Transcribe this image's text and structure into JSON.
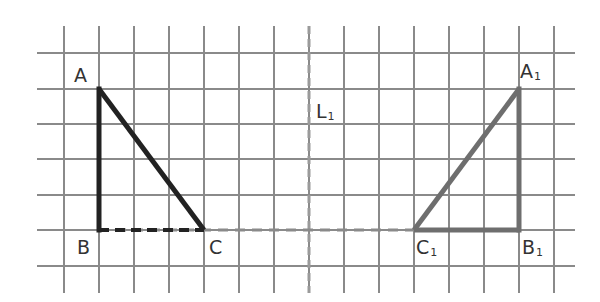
{
  "diagram": {
    "type": "reflection-on-grid",
    "grid": {
      "cell_size": 35.2,
      "x_lines": [
        64,
        99,
        134,
        169,
        204,
        239,
        274,
        309,
        344,
        379,
        414,
        449,
        484,
        519,
        554
      ],
      "y_lines": [
        53,
        89,
        124,
        159,
        195,
        230,
        266
      ],
      "x_extent": [
        37,
        575
      ],
      "y_extent": [
        26,
        293
      ],
      "color": "#8a8a8a"
    },
    "original_triangle": {
      "name": "ABC",
      "color": "#222222",
      "vertices": {
        "A": {
          "label": "A",
          "x": 99,
          "y": 89
        },
        "B": {
          "label": "B",
          "x": 99,
          "y": 230
        },
        "C": {
          "label": "C",
          "x": 204,
          "y": 230
        }
      }
    },
    "image_triangle": {
      "name": "A1B1C1",
      "color": "#6e6e6e",
      "vertices": {
        "A1": {
          "label": "A",
          "sub": "1",
          "x": 519,
          "y": 89
        },
        "B1": {
          "label": "B",
          "sub": "1",
          "x": 519,
          "y": 230
        },
        "C1": {
          "label": "C",
          "sub": "1",
          "x": 414,
          "y": 230
        }
      }
    },
    "mirror_line": {
      "label": "L",
      "sub": "1",
      "x": 309,
      "style": "dashed",
      "color": "#9a9a9a"
    },
    "dashed_baseline": {
      "from_x": 99,
      "to_x": 414,
      "y": 230,
      "color": "#8a8a8a"
    }
  },
  "labels": {
    "A": "A",
    "B": "B",
    "C": "C",
    "A1_main": "A",
    "A1_sub": "1",
    "B1_main": "B",
    "B1_sub": "1",
    "C1_main": "C",
    "C1_sub": "1",
    "L1_main": "L",
    "L1_sub": "1"
  }
}
